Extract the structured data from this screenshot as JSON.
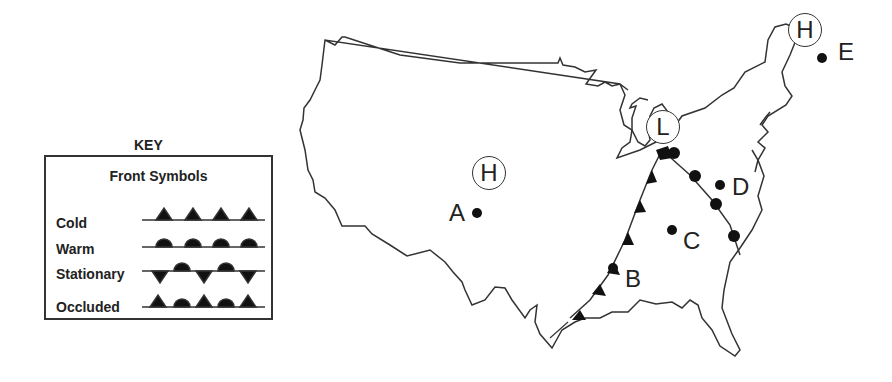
{
  "key": {
    "title": "KEY",
    "subtitle": "Front Symbols",
    "items": [
      {
        "label": "Cold"
      },
      {
        "label": "Warm"
      },
      {
        "label": "Stationary"
      },
      {
        "label": "Occluded"
      }
    ]
  },
  "pressure_systems": [
    {
      "symbol": "H",
      "location": "central plains"
    },
    {
      "symbol": "L",
      "location": "great lakes"
    },
    {
      "symbol": "H",
      "location": "northeast"
    }
  ],
  "points": [
    {
      "label": "A"
    },
    {
      "label": "B"
    },
    {
      "label": "C"
    },
    {
      "label": "D"
    },
    {
      "label": "E"
    }
  ]
}
